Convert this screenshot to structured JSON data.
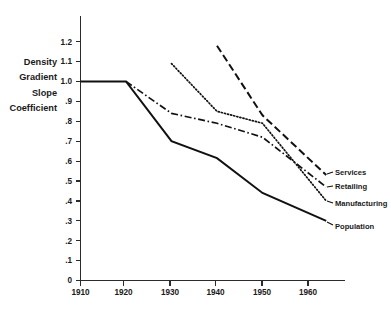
{
  "chart_data": {
    "type": "line",
    "title": "",
    "subtitle": "",
    "xlabel": "",
    "ylabel": "Density Gradient Slope Coefficient",
    "ylabel_lines": [
      "Density",
      "Gradient",
      "Slope",
      "Coefficient"
    ],
    "x": [
      1910,
      1920,
      1930,
      1940,
      1950,
      1960,
      1964
    ],
    "xlim": [
      1910,
      1965
    ],
    "ylim": [
      0,
      1.25
    ],
    "xticks": [
      1910,
      1920,
      1930,
      1940,
      1950,
      1960
    ],
    "xtick_labels": [
      "1910",
      "1920",
      "1930",
      "1940",
      "1950",
      "1960"
    ],
    "yticks": [
      0,
      0.1,
      0.2,
      0.3,
      0.4,
      0.5,
      0.6,
      0.7,
      0.8,
      0.9,
      1.0,
      1.1,
      1.2
    ],
    "ytick_labels": [
      "0",
      ".1",
      ".2",
      ".3",
      ".4",
      ".5",
      ".6",
      ".7",
      ".8",
      ".9",
      "1.0",
      "1.1",
      "1.2"
    ],
    "grid": false,
    "legend_position": "right-inline-labels",
    "series": [
      {
        "name": "Services",
        "label": "Services",
        "style": "dashed",
        "x": [
          1940,
          1950,
          1964
        ],
        "values": [
          1.18,
          0.83,
          0.53
        ]
      },
      {
        "name": "Retailing",
        "label": "Retailing",
        "style": "dash-dot",
        "x": [
          1920,
          1930,
          1940,
          1950,
          1964
        ],
        "values": [
          1.0,
          0.84,
          0.79,
          0.72,
          0.47
        ]
      },
      {
        "name": "Manufacturing",
        "label": "Manufacturing",
        "style": "dotted",
        "x": [
          1930,
          1940,
          1950,
          1964
        ],
        "values": [
          1.09,
          0.85,
          0.79,
          0.4
        ]
      },
      {
        "name": "Population",
        "label": "Population",
        "style": "solid",
        "x": [
          1910,
          1920,
          1930,
          1940,
          1950,
          1964
        ],
        "values": [
          1.0,
          1.0,
          0.7,
          0.615,
          0.44,
          0.3
        ]
      }
    ]
  },
  "colors": {
    "background": "#ffffff",
    "ink": "#111111",
    "axis": "#2b2b2b"
  }
}
